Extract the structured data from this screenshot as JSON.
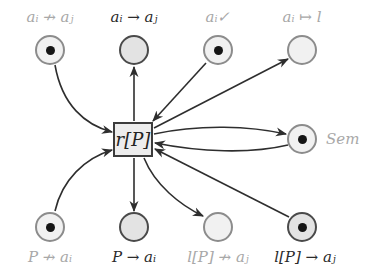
{
  "diagram": {
    "type": "petri-net",
    "transition": {
      "id": "r",
      "label": "r[P]"
    },
    "places": [
      {
        "id": "p_top1",
        "label": "aᵢ ↛ aⱼ",
        "token": true,
        "emphasis": "faint"
      },
      {
        "id": "p_top2",
        "label": "aᵢ → aⱼ",
        "token": false,
        "emphasis": "bold"
      },
      {
        "id": "p_top3",
        "label": "aᵢ✓",
        "token": true,
        "emphasis": "faint"
      },
      {
        "id": "p_top4",
        "label": "aᵢ ↦ l",
        "token": false,
        "emphasis": "faint"
      },
      {
        "id": "p_sem",
        "label": "Sem",
        "token": true,
        "emphasis": "faint"
      },
      {
        "id": "p_bot1",
        "label": "P ↛ aᵢ",
        "token": true,
        "emphasis": "faint"
      },
      {
        "id": "p_bot2",
        "label": "P → aᵢ",
        "token": false,
        "emphasis": "bold"
      },
      {
        "id": "p_bot3",
        "label": "l[P] ↛ aⱼ",
        "token": false,
        "emphasis": "faint"
      },
      {
        "id": "p_bot4",
        "label": "l[P] → aⱼ",
        "token": true,
        "emphasis": "bold"
      }
    ],
    "arcs": [
      {
        "from": "p_top1",
        "to": "r"
      },
      {
        "from": "r",
        "to": "p_top2"
      },
      {
        "from": "p_top3",
        "to": "r"
      },
      {
        "from": "r",
        "to": "p_top4"
      },
      {
        "from": "r",
        "to": "p_sem"
      },
      {
        "from": "p_sem",
        "to": "r"
      },
      {
        "from": "p_bot1",
        "to": "r"
      },
      {
        "from": "r",
        "to": "p_bot2"
      },
      {
        "from": "r",
        "to": "p_bot3"
      },
      {
        "from": "p_bot4",
        "to": "r"
      }
    ],
    "colors": {
      "edge": "#2e2e2e",
      "token": "#151515",
      "faint_label": "#a8a8a8",
      "bold_label": "#2a2a2a"
    }
  }
}
